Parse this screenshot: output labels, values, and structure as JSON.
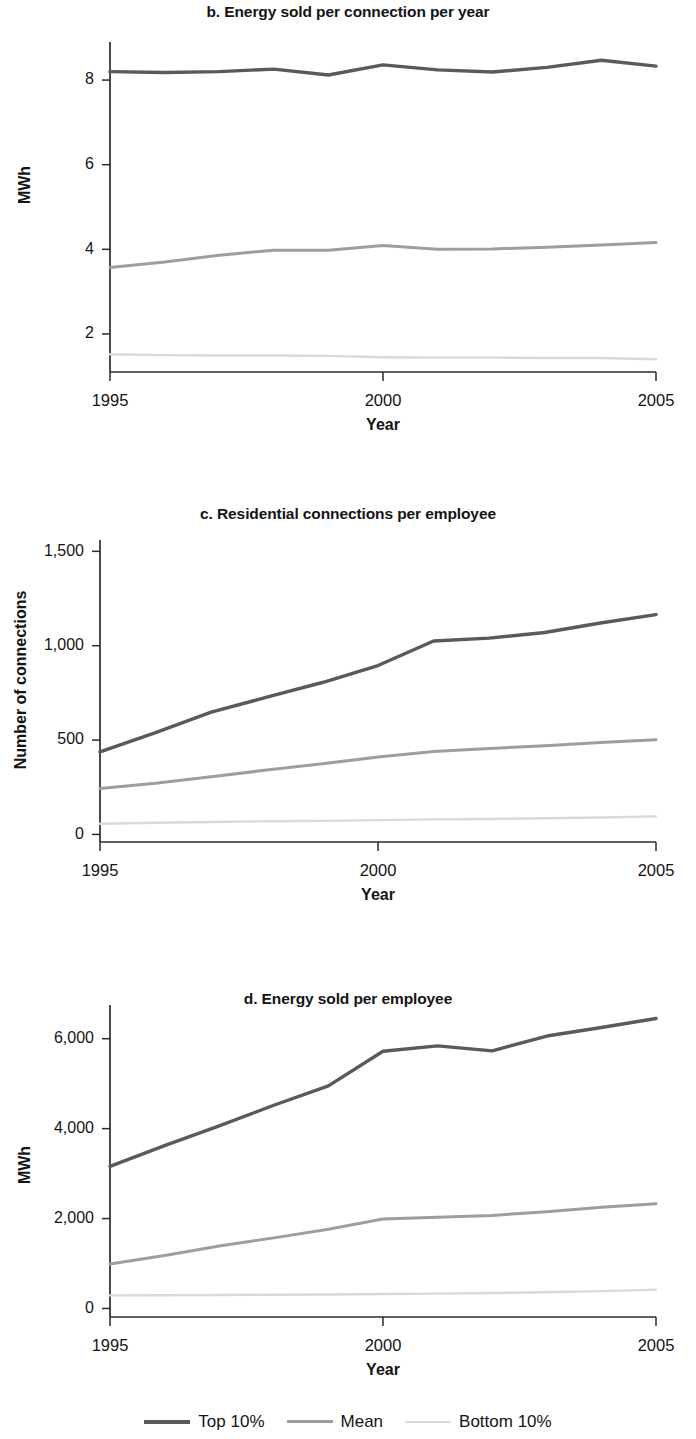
{
  "figure": {
    "panels": [
      "b",
      "c",
      "d"
    ]
  },
  "legend": {
    "position": "bottom-center",
    "entries": [
      {
        "label": "Top 10%",
        "color": "#5a5a5a"
      },
      {
        "label": "Mean",
        "color": "#9e9e9e"
      },
      {
        "label": "Bottom 10%",
        "color": "#d9d9d9"
      }
    ]
  },
  "chart_data": [
    {
      "id": "b",
      "type": "line",
      "title": "b. Energy sold per connection per year",
      "xlabel": "Year",
      "ylabel": "MWh",
      "x": [
        1995,
        1996,
        1997,
        1998,
        1999,
        2000,
        2001,
        2002,
        2003,
        2004,
        2005
      ],
      "xtick_labels": [
        "1995",
        "2000",
        "2005"
      ],
      "xticks": [
        1995,
        2000,
        2005
      ],
      "xlim": [
        1995,
        2005
      ],
      "ytick_labels": [
        "2",
        "4",
        "6",
        "8"
      ],
      "yticks": [
        2,
        4,
        6,
        8
      ],
      "ylim": [
        1.1,
        8.9
      ],
      "grid": false,
      "series": [
        {
          "name": "Top 10%",
          "color": "#5a5a5a",
          "values": [
            8.2,
            8.18,
            8.2,
            8.26,
            8.12,
            8.36,
            8.24,
            8.19,
            8.3,
            8.47,
            8.33
          ]
        },
        {
          "name": "Mean",
          "color": "#9e9e9e",
          "values": [
            3.57,
            3.7,
            3.86,
            3.98,
            3.98,
            4.09,
            4.0,
            4.01,
            4.05,
            4.1,
            4.16
          ]
        },
        {
          "name": "Bottom 10%",
          "color": "#d9d9d9",
          "values": [
            1.52,
            1.5,
            1.49,
            1.49,
            1.48,
            1.45,
            1.44,
            1.44,
            1.43,
            1.43,
            1.4
          ]
        }
      ]
    },
    {
      "id": "c",
      "type": "line",
      "title": "c. Residential connections per employee",
      "xlabel": "Year",
      "ylabel": "Number of connections",
      "x": [
        1995,
        1996,
        1997,
        1998,
        1999,
        2000,
        2001,
        2002,
        2003,
        2004,
        2005
      ],
      "xtick_labels": [
        "1995",
        "2000",
        "2005"
      ],
      "xticks": [
        1995,
        2000,
        2005
      ],
      "xlim": [
        1995,
        2005
      ],
      "ytick_labels": [
        "0",
        "500",
        "1,000",
        "1,500"
      ],
      "yticks": [
        0,
        500,
        1000,
        1500
      ],
      "ylim": [
        -40,
        1560
      ],
      "grid": false,
      "series": [
        {
          "name": "Top 10%",
          "color": "#5a5a5a",
          "values": [
            437,
            540,
            648,
            727,
            805,
            895,
            1025,
            1040,
            1070,
            1120,
            1165
          ]
        },
        {
          "name": "Mean",
          "color": "#9e9e9e",
          "values": [
            243,
            271,
            306,
            341,
            374,
            410,
            440,
            455,
            470,
            487,
            502
          ]
        },
        {
          "name": "Bottom 10%",
          "color": "#d9d9d9",
          "values": [
            57,
            62,
            66,
            70,
            72,
            76,
            80,
            82,
            86,
            90,
            96
          ]
        }
      ]
    },
    {
      "id": "d",
      "type": "line",
      "title": "d. Energy sold per employee",
      "xlabel": "Year",
      "ylabel": "MWh",
      "x": [
        1995,
        1996,
        1997,
        1998,
        1999,
        2000,
        2001,
        2002,
        2003,
        2004,
        2005
      ],
      "xtick_labels": [
        "1995",
        "2000",
        "2005"
      ],
      "xticks": [
        1995,
        2000,
        2005
      ],
      "xlim": [
        1995,
        2005
      ],
      "ytick_labels": [
        "0",
        "2,000",
        "4,000",
        "6,000"
      ],
      "yticks": [
        0,
        2000,
        4000,
        6000
      ],
      "ylim": [
        -190,
        6750
      ],
      "grid": false,
      "series": [
        {
          "name": "Top 10%",
          "color": "#5a5a5a",
          "values": [
            3160,
            3620,
            4060,
            4520,
            4950,
            5720,
            5840,
            5730,
            6060,
            6250,
            6450
          ]
        },
        {
          "name": "Mean",
          "color": "#9e9e9e",
          "values": [
            990,
            1180,
            1390,
            1570,
            1760,
            1990,
            2030,
            2070,
            2150,
            2250,
            2330
          ]
        },
        {
          "name": "Bottom 10%",
          "color": "#d9d9d9",
          "values": [
            290,
            295,
            300,
            305,
            310,
            320,
            330,
            345,
            360,
            385,
            420
          ]
        }
      ]
    }
  ]
}
